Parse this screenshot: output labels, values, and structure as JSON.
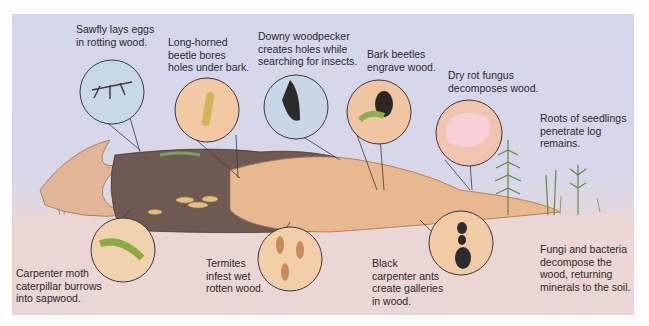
{
  "diagram": {
    "colors": {
      "sky": "#d4d6ea",
      "soil": "#ecdcdc",
      "bark_dark": "#6e5a52",
      "wood_light": "#e8b98e",
      "callout_line": "#3a3a3a"
    },
    "labels": [
      {
        "id": "sawfly",
        "text": "Sawfly lays eggs\nin rotting wood."
      },
      {
        "id": "long-horned-beetle",
        "text": "Long-horned\nbeetle bores\nholes under bark."
      },
      {
        "id": "woodpecker",
        "text": "Downy woodpecker\ncreates holes while\nsearching for insects."
      },
      {
        "id": "bark-beetles",
        "text": "Bark beetles\nengrave wood."
      },
      {
        "id": "dry-rot",
        "text": "Dry rot fungus\ndecomposes wood."
      },
      {
        "id": "seedlings",
        "text": "Roots of seedlings\npenetrate log\nremains."
      },
      {
        "id": "carpenter-moth",
        "text": "Carpenter moth\ncaterpillar burrows\ninto sapwood."
      },
      {
        "id": "termites",
        "text": "Termites\ninfest wet\nrotten wood."
      },
      {
        "id": "carpenter-ants",
        "text": "Black\ncarpenter ants\ncreate galleries\nin wood."
      },
      {
        "id": "fungi-bacteria",
        "text": "Fungi and bacteria\ndecompose the\nwood, returning\nminerals to the soil."
      }
    ]
  }
}
